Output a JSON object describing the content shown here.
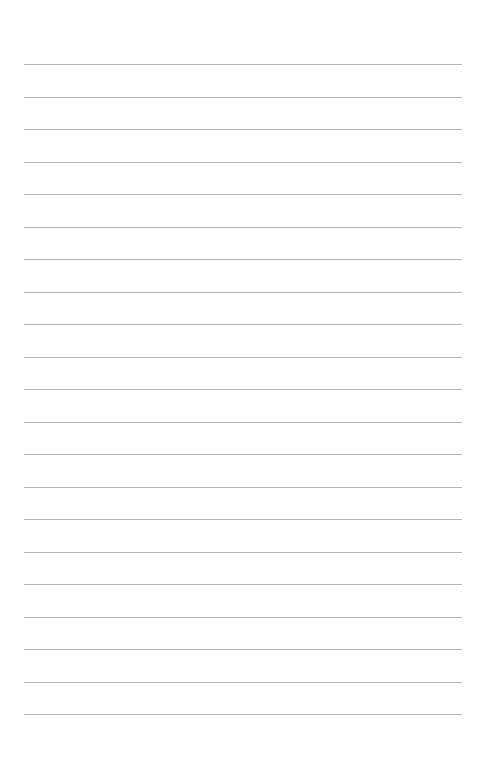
{
  "page": {
    "type": "lined-paper",
    "background_color": "#ffffff",
    "line_color": "#b8b8b8",
    "line_count": 21,
    "first_line_y": 64,
    "line_spacing": 32.5,
    "line_left": 24,
    "line_width": 438
  }
}
